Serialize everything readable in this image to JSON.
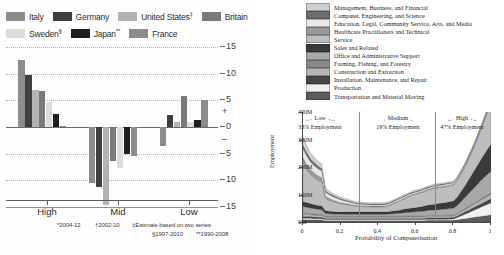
{
  "left_chart": {
    "legend": [
      {
        "label": "Italy",
        "color": "#8c8c8c",
        "note": ""
      },
      {
        "label": "Germany",
        "color": "#3f3f3f",
        "note": ""
      },
      {
        "label": "United States",
        "color": "#b3b3b3",
        "note": "‡"
      },
      {
        "label": "Britain",
        "color": "#7a7a7a",
        "note": ""
      },
      {
        "label": "Sweden",
        "color": "#dcdcdc",
        "note": "§"
      },
      {
        "label": "Japan",
        "color": "#1e1e1e",
        "note": "**"
      },
      {
        "label": "France",
        "color": "#8c8c8c",
        "note": ""
      }
    ],
    "yticks": [
      "15",
      "10",
      "5",
      "+",
      "0",
      "–",
      "5",
      "10",
      "15"
    ],
    "group_labels": [
      "High",
      "Mid",
      "Low"
    ],
    "footnotes": [
      "*2004-12",
      "†2002-10",
      "‡Estimate based on two series",
      "§1997-2010",
      "**1990-2008"
    ],
    "chart_data": {
      "type": "bar",
      "title": "",
      "xlabel": "",
      "ylabel": "",
      "ylim": [
        -15,
        15
      ],
      "categories": [
        "High",
        "Mid",
        "Low"
      ],
      "grid": true,
      "legend_position": "top",
      "series": [
        {
          "name": "Italy",
          "color": "#8c8c8c",
          "values": [
            12.5,
            -10.5,
            -3.6
          ]
        },
        {
          "name": "Germany",
          "color": "#3f3f3f",
          "values": [
            9.8,
            -11.2,
            2.2
          ]
        },
        {
          "name": "United States",
          "color": "#b3b3b3",
          "values": [
            7.0,
            -14.7,
            1.0
          ]
        },
        {
          "name": "Britain",
          "color": "#7a7a7a",
          "values": [
            6.7,
            -6.3,
            5.8
          ]
        },
        {
          "name": "Sweden",
          "color": "#dcdcdc",
          "values": [
            4.6,
            -7.6,
            0.9
          ]
        },
        {
          "name": "Japan",
          "color": "#1e1e1e",
          "values": [
            2.4,
            -5.0,
            1.4
          ]
        },
        {
          "name": "France",
          "color": "#8c8c8c",
          "values": [
            0.2,
            -5.5,
            5.0
          ]
        }
      ]
    }
  },
  "right_chart": {
    "legend": [
      {
        "label": "Management, Business, and Financial",
        "color": "#cfcfcf"
      },
      {
        "label": "Computer, Engineering, and Science",
        "color": "#6e6e6e"
      },
      {
        "label": "Education, Legal, Community Service, Arts, and Media",
        "color": "#e8e8e8"
      },
      {
        "label": "Healthcare Practitioners and Technical",
        "color": "#9a9a9a"
      },
      {
        "label": "Service",
        "color": "#bdbdbd"
      },
      {
        "label": "Sales and Related",
        "color": "#3a3a3a"
      },
      {
        "label": "Office and Administrative Support",
        "color": "#a8a8a8"
      },
      {
        "label": "Farming, Fishing, and Forestry",
        "color": "#8a8a8a"
      },
      {
        "label": "Construction and Extraction",
        "color": "#b5b5b5"
      },
      {
        "label": "Installation, Maintenance, and Repair",
        "color": "#474747"
      },
      {
        "label": "Production",
        "color": "#f0f0f0"
      },
      {
        "label": "Transportation and Material Moving",
        "color": "#5c5c5c"
      }
    ],
    "annotations": [
      {
        "title": "Low",
        "sub": "33% Employment",
        "arrow": "←————→"
      },
      {
        "title": "Medium",
        "sub": "19% Employment",
        "arrow": "←————→"
      },
      {
        "title": "High",
        "sub": "47% Employment",
        "arrow": "←————→"
      }
    ],
    "chart_data": {
      "type": "area",
      "title": "",
      "xlabel": "Probability of Computerisation",
      "ylabel": "Employment",
      "xlim": [
        0,
        1
      ],
      "ylim": [
        0,
        400
      ],
      "xticks": [
        "0",
        "0.2",
        "0.4",
        "0.6",
        "0.8",
        "1"
      ],
      "yticks": [
        "0M",
        "100M",
        "200M",
        "300M",
        "400M"
      ],
      "grid": false,
      "legend_position": "top",
      "boundaries": [
        0.3,
        0.7
      ],
      "x": [
        0.0,
        0.02,
        0.04,
        0.06,
        0.08,
        0.1,
        0.12,
        0.14,
        0.16,
        0.18,
        0.2,
        0.22,
        0.24,
        0.26,
        0.28,
        0.3,
        0.32,
        0.34,
        0.36,
        0.38,
        0.4,
        0.42,
        0.44,
        0.46,
        0.48,
        0.5,
        0.52,
        0.54,
        0.56,
        0.58,
        0.6,
        0.62,
        0.64,
        0.66,
        0.68,
        0.7,
        0.72,
        0.74,
        0.76,
        0.78,
        0.8,
        0.82,
        0.84,
        0.86,
        0.88,
        0.9,
        0.92,
        0.94,
        0.96,
        0.98,
        1.0
      ],
      "series": [
        {
          "name": "Management, Business, and Financial",
          "color": "#cfcfcf",
          "values": [
            30,
            26,
            22,
            20,
            18,
            17,
            10,
            9,
            8,
            7,
            7,
            6,
            6,
            5,
            5,
            5,
            5,
            4,
            4,
            4,
            4,
            4,
            4,
            4,
            4,
            4,
            4,
            4,
            4,
            4,
            4,
            4,
            4,
            4,
            4,
            4,
            4,
            4,
            4,
            4,
            4,
            4,
            4,
            4,
            4,
            4,
            4,
            4,
            4,
            4,
            4
          ]
        },
        {
          "name": "Computer, Engineering, and Science",
          "color": "#6e6e6e",
          "values": [
            14,
            13,
            12,
            11,
            10,
            9,
            6,
            5,
            5,
            4,
            4,
            4,
            3,
            3,
            3,
            3,
            3,
            3,
            3,
            3,
            3,
            3,
            3,
            3,
            3,
            3,
            3,
            3,
            3,
            3,
            3,
            3,
            3,
            3,
            3,
            3,
            3,
            3,
            3,
            3,
            3,
            3,
            3,
            3,
            3,
            3,
            3,
            3,
            3,
            3,
            3
          ]
        },
        {
          "name": "Education, Legal, Community Service, Arts, and Media",
          "color": "#e8e8e8",
          "values": [
            32,
            30,
            28,
            27,
            26,
            25,
            14,
            13,
            12,
            11,
            10,
            9,
            8,
            7,
            6,
            6,
            5,
            5,
            5,
            5,
            5,
            5,
            5,
            5,
            5,
            5,
            5,
            5,
            5,
            5,
            5,
            5,
            5,
            5,
            5,
            5,
            5,
            5,
            5,
            5,
            5,
            5,
            5,
            5,
            5,
            5,
            5,
            5,
            5,
            5,
            5
          ]
        },
        {
          "name": "Healthcare Practitioners and Technical",
          "color": "#9a9a9a",
          "values": [
            20,
            19,
            18,
            17,
            16,
            15,
            8,
            7,
            6,
            5,
            5,
            4,
            4,
            3,
            3,
            3,
            3,
            3,
            3,
            3,
            3,
            3,
            3,
            3,
            3,
            3,
            3,
            3,
            3,
            3,
            3,
            3,
            3,
            3,
            3,
            3,
            3,
            3,
            3,
            3,
            3,
            3,
            3,
            3,
            3,
            3,
            3,
            3,
            3,
            3,
            3
          ]
        },
        {
          "name": "Service",
          "color": "#bdbdbd",
          "values": [
            140,
            120,
            105,
            98,
            92,
            88,
            45,
            40,
            36,
            33,
            30,
            28,
            26,
            24,
            22,
            21,
            20,
            20,
            19,
            19,
            19,
            19,
            20,
            22,
            26,
            30,
            34,
            38,
            42,
            46,
            48,
            50,
            52,
            54,
            56,
            58,
            58,
            58,
            58,
            58,
            58,
            60,
            64,
            68,
            74,
            82,
            92,
            104,
            118,
            134,
            150
          ]
        },
        {
          "name": "Sales and Related",
          "color": "#3a3a3a",
          "values": [
            18,
            17,
            16,
            15,
            14,
            13,
            10,
            9,
            9,
            8,
            8,
            8,
            8,
            8,
            8,
            8,
            8,
            8,
            8,
            8,
            8,
            8,
            8,
            9,
            10,
            11,
            12,
            13,
            14,
            15,
            16,
            17,
            18,
            19,
            20,
            21,
            22,
            23,
            24,
            25,
            26,
            30,
            36,
            42,
            50,
            58,
            66,
            74,
            82,
            90,
            98
          ]
        },
        {
          "name": "Office and Administrative Support",
          "color": "#a8a8a8",
          "values": [
            24,
            22,
            20,
            19,
            18,
            17,
            10,
            9,
            8,
            8,
            7,
            7,
            7,
            7,
            7,
            7,
            7,
            7,
            7,
            7,
            7,
            7,
            7,
            8,
            9,
            10,
            11,
            12,
            13,
            14,
            15,
            16,
            17,
            18,
            19,
            20,
            21,
            22,
            23,
            24,
            25,
            28,
            34,
            40,
            46,
            52,
            58,
            64,
            70,
            74,
            78
          ]
        },
        {
          "name": "Farming, Fishing, and Forestry",
          "color": "#8a8a8a",
          "values": [
            4,
            4,
            4,
            4,
            4,
            4,
            3,
            3,
            3,
            3,
            3,
            3,
            3,
            3,
            3,
            3,
            3,
            3,
            3,
            3,
            3,
            3,
            3,
            3,
            3,
            3,
            3,
            3,
            3,
            3,
            3,
            3,
            3,
            3,
            3,
            3,
            3,
            3,
            3,
            3,
            3,
            3,
            3,
            3,
            4,
            4,
            4,
            5,
            5,
            6,
            6
          ]
        },
        {
          "name": "Construction and Extraction",
          "color": "#b5b5b5",
          "values": [
            8,
            8,
            7,
            7,
            7,
            7,
            5,
            5,
            5,
            5,
            5,
            5,
            5,
            5,
            5,
            5,
            5,
            5,
            5,
            5,
            5,
            5,
            5,
            5,
            5,
            5,
            5,
            6,
            6,
            6,
            6,
            6,
            6,
            6,
            6,
            6,
            6,
            6,
            6,
            6,
            6,
            7,
            8,
            9,
            10,
            11,
            12,
            13,
            14,
            15,
            16
          ]
        },
        {
          "name": "Installation, Maintenance, and Repair",
          "color": "#474747",
          "values": [
            6,
            6,
            6,
            6,
            5,
            5,
            4,
            4,
            4,
            4,
            4,
            4,
            4,
            4,
            4,
            4,
            4,
            4,
            4,
            4,
            4,
            4,
            4,
            4,
            4,
            4,
            4,
            4,
            4,
            4,
            4,
            4,
            4,
            5,
            5,
            5,
            5,
            5,
            5,
            5,
            5,
            6,
            7,
            8,
            9,
            10,
            11,
            12,
            13,
            14,
            15
          ]
        },
        {
          "name": "Production",
          "color": "#f0f0f0",
          "values": [
            6,
            6,
            6,
            5,
            5,
            5,
            4,
            4,
            4,
            4,
            4,
            4,
            4,
            4,
            4,
            4,
            4,
            4,
            4,
            4,
            4,
            4,
            4,
            4,
            4,
            4,
            4,
            4,
            4,
            4,
            4,
            4,
            4,
            4,
            4,
            4,
            4,
            4,
            4,
            5,
            5,
            8,
            12,
            16,
            20,
            24,
            28,
            32,
            36,
            40,
            44
          ]
        },
        {
          "name": "Transportation and Material Moving",
          "color": "#5c5c5c",
          "values": [
            8,
            8,
            8,
            7,
            7,
            7,
            5,
            5,
            5,
            5,
            5,
            5,
            5,
            5,
            5,
            5,
            5,
            5,
            5,
            5,
            5,
            5,
            5,
            5,
            5,
            5,
            5,
            5,
            5,
            5,
            5,
            5,
            5,
            6,
            6,
            6,
            6,
            6,
            6,
            6,
            6,
            8,
            10,
            12,
            14,
            16,
            18,
            20,
            22,
            24,
            26
          ]
        }
      ]
    }
  }
}
